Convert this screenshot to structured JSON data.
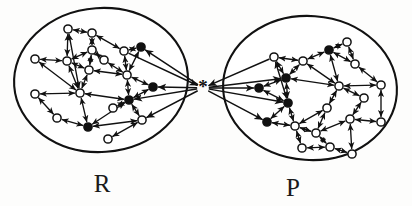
{
  "figure": {
    "background_color": "#fdfdfc",
    "ink_color": "#111111",
    "width": 412,
    "height": 206
  },
  "hub": {
    "name": "central-junction",
    "glyph": "✳",
    "label": "*",
    "x": 203,
    "y": 88,
    "description": "asterisk hub joining cluster R and cluster P"
  },
  "clusters": [
    {
      "id": "R",
      "label": "R",
      "label_x": 102,
      "label_y": 192,
      "outline": {
        "cx": 101,
        "cy": 80,
        "rx": 87,
        "ry": 72,
        "rotate": -4
      },
      "node_counts": {
        "open": 14,
        "filled": 5,
        "total": 19
      }
    },
    {
      "id": "P",
      "label": "P",
      "label_x": 293,
      "label_y": 196,
      "outline": {
        "cx": 310,
        "cy": 88,
        "rx": 87,
        "ry": 72,
        "rotate": 4
      },
      "node_counts": {
        "open": 15,
        "filled": 5,
        "total": 20
      }
    }
  ],
  "nodes_R": [
    {
      "id": "r1",
      "x": 68,
      "y": 29,
      "type": "open"
    },
    {
      "id": "r2",
      "x": 92,
      "y": 33,
      "type": "open"
    },
    {
      "id": "r3",
      "x": 35,
      "y": 59,
      "type": "open"
    },
    {
      "id": "r4",
      "x": 67,
      "y": 61,
      "type": "open"
    },
    {
      "id": "r5",
      "x": 92,
      "y": 50,
      "type": "open"
    },
    {
      "id": "r6",
      "x": 124,
      "y": 51,
      "type": "open"
    },
    {
      "id": "r7",
      "x": 141,
      "y": 47,
      "type": "filled"
    },
    {
      "id": "r8",
      "x": 89,
      "y": 70,
      "type": "open"
    },
    {
      "id": "r9",
      "x": 127,
      "y": 75,
      "type": "open"
    },
    {
      "id": "r10",
      "x": 153,
      "y": 87,
      "type": "filled"
    },
    {
      "id": "r11",
      "x": 35,
      "y": 94,
      "type": "open"
    },
    {
      "id": "r12",
      "x": 80,
      "y": 93,
      "type": "open"
    },
    {
      "id": "r13",
      "x": 129,
      "y": 100,
      "type": "filled"
    },
    {
      "id": "r14",
      "x": 57,
      "y": 118,
      "type": "open"
    },
    {
      "id": "r15",
      "x": 88,
      "y": 127,
      "type": "filled"
    },
    {
      "id": "r16",
      "x": 108,
      "y": 139,
      "type": "open"
    },
    {
      "id": "r17",
      "x": 142,
      "y": 120,
      "type": "open"
    },
    {
      "id": "r18",
      "x": 113,
      "y": 108,
      "type": "open"
    },
    {
      "id": "r19",
      "x": 104,
      "y": 60,
      "type": "open"
    }
  ],
  "nodes_P": [
    {
      "id": "p1",
      "x": 274,
      "y": 57,
      "type": "open"
    },
    {
      "id": "p2",
      "x": 303,
      "y": 61,
      "type": "open"
    },
    {
      "id": "p3",
      "x": 329,
      "y": 50,
      "type": "filled"
    },
    {
      "id": "p4",
      "x": 347,
      "y": 42,
      "type": "open"
    },
    {
      "id": "p5",
      "x": 355,
      "y": 64,
      "type": "open"
    },
    {
      "id": "p6",
      "x": 286,
      "y": 78,
      "type": "filled"
    },
    {
      "id": "p7",
      "x": 259,
      "y": 88,
      "type": "filled"
    },
    {
      "id": "p8",
      "x": 339,
      "y": 86,
      "type": "open"
    },
    {
      "id": "p9",
      "x": 381,
      "y": 85,
      "type": "open"
    },
    {
      "id": "p10",
      "x": 288,
      "y": 103,
      "type": "filled"
    },
    {
      "id": "p11",
      "x": 327,
      "y": 108,
      "type": "open"
    },
    {
      "id": "p12",
      "x": 267,
      "y": 122,
      "type": "filled"
    },
    {
      "id": "p13",
      "x": 295,
      "y": 126,
      "type": "open"
    },
    {
      "id": "p14",
      "x": 350,
      "y": 119,
      "type": "open"
    },
    {
      "id": "p15",
      "x": 381,
      "y": 122,
      "type": "open"
    },
    {
      "id": "p16",
      "x": 302,
      "y": 148,
      "type": "open"
    },
    {
      "id": "p17",
      "x": 330,
      "y": 147,
      "type": "open"
    },
    {
      "id": "p18",
      "x": 352,
      "y": 154,
      "type": "open"
    },
    {
      "id": "p19",
      "x": 316,
      "y": 133,
      "type": "open"
    },
    {
      "id": "p20",
      "x": 364,
      "y": 98,
      "type": "open"
    }
  ],
  "edges_R": [
    {
      "a": "r1",
      "b": "r2",
      "dir": "both"
    },
    {
      "a": "r1",
      "b": "r4",
      "dir": "both"
    },
    {
      "a": "r2",
      "b": "r5",
      "dir": "both"
    },
    {
      "a": "r2",
      "b": "r6",
      "dir": "both"
    },
    {
      "a": "r3",
      "b": "r4",
      "dir": "both"
    },
    {
      "a": "r4",
      "b": "r5",
      "dir": "both"
    },
    {
      "a": "r4",
      "b": "r8",
      "dir": "both"
    },
    {
      "a": "r5",
      "b": "r8",
      "dir": "both"
    },
    {
      "a": "r5",
      "b": "r19",
      "dir": "both"
    },
    {
      "a": "r6",
      "b": "r7",
      "dir": "both"
    },
    {
      "a": "r6",
      "b": "r9",
      "dir": "both"
    },
    {
      "a": "r7",
      "b": "r9",
      "dir": "both"
    },
    {
      "a": "r8",
      "b": "r9",
      "dir": "both"
    },
    {
      "a": "r8",
      "b": "r12",
      "dir": "both"
    },
    {
      "a": "r9",
      "b": "r10",
      "dir": "both"
    },
    {
      "a": "r9",
      "b": "r13",
      "dir": "both"
    },
    {
      "a": "r10",
      "b": "r13",
      "dir": "both"
    },
    {
      "a": "r11",
      "b": "r12",
      "dir": "both"
    },
    {
      "a": "r11",
      "b": "r14",
      "dir": "both"
    },
    {
      "a": "r12",
      "b": "r13",
      "dir": "both"
    },
    {
      "a": "r12",
      "b": "r15",
      "dir": "both"
    },
    {
      "a": "r12",
      "b": "r4",
      "dir": "both"
    },
    {
      "a": "r13",
      "b": "r15",
      "dir": "both"
    },
    {
      "a": "r13",
      "b": "r17",
      "dir": "both"
    },
    {
      "a": "r14",
      "b": "r15",
      "dir": "both"
    },
    {
      "a": "r15",
      "b": "r17",
      "dir": "both"
    },
    {
      "a": "r16",
      "b": "r17",
      "dir": "both"
    },
    {
      "a": "r18",
      "b": "r13",
      "dir": "both"
    },
    {
      "a": "r3",
      "b": "r12",
      "dir": "both"
    },
    {
      "a": "r1",
      "b": "r12",
      "dir": "both"
    },
    {
      "a": "r19",
      "b": "r9",
      "dir": "both"
    }
  ],
  "edges_P": [
    {
      "a": "p1",
      "b": "p2",
      "dir": "both"
    },
    {
      "a": "p1",
      "b": "p6",
      "dir": "both"
    },
    {
      "a": "p2",
      "b": "p3",
      "dir": "both"
    },
    {
      "a": "p2",
      "b": "p6",
      "dir": "both"
    },
    {
      "a": "p3",
      "b": "p4",
      "dir": "both"
    },
    {
      "a": "p3",
      "b": "p5",
      "dir": "both"
    },
    {
      "a": "p3",
      "b": "p8",
      "dir": "both"
    },
    {
      "a": "p4",
      "b": "p5",
      "dir": "both"
    },
    {
      "a": "p5",
      "b": "p9",
      "dir": "both"
    },
    {
      "a": "p6",
      "b": "p7",
      "dir": "both"
    },
    {
      "a": "p6",
      "b": "p10",
      "dir": "both"
    },
    {
      "a": "p6",
      "b": "p8",
      "dir": "both"
    },
    {
      "a": "p7",
      "b": "p10",
      "dir": "both"
    },
    {
      "a": "p8",
      "b": "p9",
      "dir": "both"
    },
    {
      "a": "p8",
      "b": "p11",
      "dir": "both"
    },
    {
      "a": "p8",
      "b": "p20",
      "dir": "both"
    },
    {
      "a": "p9",
      "b": "p15",
      "dir": "both"
    },
    {
      "a": "p10",
      "b": "p13",
      "dir": "both"
    },
    {
      "a": "p10",
      "b": "p12",
      "dir": "both"
    },
    {
      "a": "p11",
      "b": "p13",
      "dir": "both"
    },
    {
      "a": "p11",
      "b": "p19",
      "dir": "both"
    },
    {
      "a": "p12",
      "b": "p13",
      "dir": "both"
    },
    {
      "a": "p13",
      "b": "p16",
      "dir": "both"
    },
    {
      "a": "p13",
      "b": "p19",
      "dir": "both"
    },
    {
      "a": "p14",
      "b": "p15",
      "dir": "both"
    },
    {
      "a": "p14",
      "b": "p19",
      "dir": "both"
    },
    {
      "a": "p14",
      "b": "p18",
      "dir": "both"
    },
    {
      "a": "p16",
      "b": "p17",
      "dir": "both"
    },
    {
      "a": "p17",
      "b": "p18",
      "dir": "both"
    },
    {
      "a": "p17",
      "b": "p19",
      "dir": "both"
    },
    {
      "a": "p20",
      "b": "p14",
      "dir": "both"
    },
    {
      "a": "p1",
      "b": "p10",
      "dir": "both"
    },
    {
      "a": "p2",
      "b": "p8",
      "dir": "both"
    }
  ],
  "hub_edges_R": [
    {
      "node": "r7",
      "dir": "to_node"
    },
    {
      "node": "r10",
      "dir": "to_node"
    },
    {
      "node": "r13",
      "dir": "to_node"
    },
    {
      "node": "r17",
      "dir": "to_node"
    },
    {
      "node": "r6",
      "dir": "to_hub"
    }
  ],
  "hub_edges_P": [
    {
      "node": "p7",
      "dir": "to_node"
    },
    {
      "node": "p6",
      "dir": "to_node"
    },
    {
      "node": "p10",
      "dir": "to_node"
    },
    {
      "node": "p12",
      "dir": "to_node"
    },
    {
      "node": "p1",
      "dir": "to_hub"
    }
  ]
}
